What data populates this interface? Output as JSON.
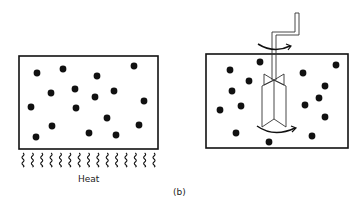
{
  "figure": {
    "panel_label": "(b)",
    "left_panel": {
      "description": "container of particles heated from below",
      "heat_label": "Heat",
      "particle_count": 17,
      "heat_wave_count": 15
    },
    "right_panel": {
      "description": "container of particles stirred by rotating paddle stirrer",
      "particle_count": 16,
      "has_stirrer": true,
      "rotation_arrows": 2
    },
    "colors": {
      "ink": "#111111",
      "background": "#ffffff"
    }
  }
}
